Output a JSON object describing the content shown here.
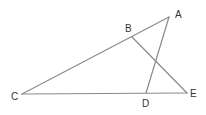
{
  "diagram": {
    "type": "geometry-figure",
    "points": {
      "A": {
        "label": "A",
        "x": 169,
        "y": 17,
        "lx": 175,
        "ly": 18
      },
      "B": {
        "label": "B",
        "x": 132,
        "y": 37,
        "lx": 125,
        "ly": 32
      },
      "C": {
        "label": "C",
        "x": 22,
        "y": 94,
        "lx": 11,
        "ly": 100
      },
      "D": {
        "label": "D",
        "x": 146,
        "y": 93,
        "lx": 142,
        "ly": 107
      },
      "E": {
        "label": "E",
        "x": 187,
        "y": 93,
        "lx": 190,
        "ly": 97
      }
    },
    "segments": [
      {
        "from": "C",
        "to": "A"
      },
      {
        "from": "C",
        "to": "E"
      },
      {
        "from": "A",
        "to": "D"
      },
      {
        "from": "B",
        "to": "E"
      }
    ],
    "colors": {
      "line": "#8a8a8a",
      "label": "#333333",
      "background": "#ffffff"
    }
  }
}
